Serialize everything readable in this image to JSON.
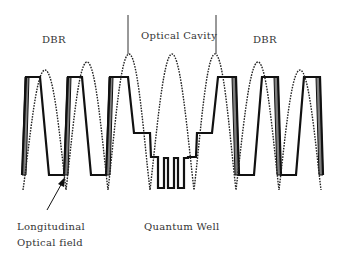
{
  "diagram": {
    "type": "VCSEL structure schematic",
    "labels": {
      "dbr_left": "DBR",
      "optical_cavity": "Optical Cavity",
      "dbr_right": "DBR",
      "longitudinal_line1": "Longitudinal",
      "longitudinal_line2": "Optical field",
      "quantum_well": "Quantum Well"
    },
    "elements": [
      {
        "name": "refractive-index-profile",
        "style": "solid thick black step line"
      },
      {
        "name": "longitudinal-optical-field",
        "style": "dotted sinusoid"
      },
      {
        "name": "cavity-boundary-markers",
        "style": "thin vertical lines"
      },
      {
        "name": "pointer-arrow",
        "points_to": "longitudinal-optical-field"
      }
    ],
    "colors": {
      "line": "#111111",
      "fill_layer": "#808080",
      "text": "#333333",
      "background": "#ffffff"
    }
  }
}
